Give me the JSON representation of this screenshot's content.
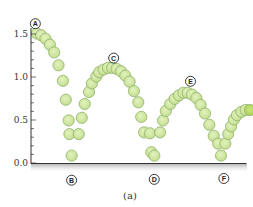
{
  "chart_data": {
    "type": "scatter",
    "title": "",
    "caption": "(a)",
    "xlabel": "",
    "ylabel": "",
    "ylim": [
      0.0,
      1.6
    ],
    "yticks": [
      0.0,
      0.5,
      1.0,
      1.5
    ],
    "ytick_labels": [
      "0.0",
      "0.5",
      "1.0",
      "1.5"
    ],
    "grid": false,
    "legend": null,
    "annotations": [
      {
        "label": "A",
        "x": 0.03,
        "y": 1.62,
        "note": "release point, top"
      },
      {
        "label": "B",
        "x": 0.28,
        "y": -0.2,
        "note": "first bounce"
      },
      {
        "label": "C",
        "x": 0.57,
        "y": 1.22,
        "note": "second peak"
      },
      {
        "label": "D",
        "x": 0.85,
        "y": -0.19,
        "note": "second bounce"
      },
      {
        "label": "E",
        "x": 1.1,
        "y": 0.95,
        "note": "third peak"
      },
      {
        "label": "F",
        "x": 1.33,
        "y": -0.18,
        "note": "third bounce"
      }
    ],
    "series": [
      {
        "name": "ball positions",
        "color": "#cfe6a0",
        "edge_color": "#8fb36a",
        "points": [
          [
            0.04,
            1.5
          ],
          [
            0.07,
            1.48
          ],
          [
            0.1,
            1.44
          ],
          [
            0.13,
            1.37
          ],
          [
            0.16,
            1.28
          ],
          [
            0.19,
            1.13
          ],
          [
            0.22,
            0.95
          ],
          [
            0.24,
            0.73
          ],
          [
            0.26,
            0.49
          ],
          [
            0.265,
            0.33
          ],
          [
            0.28,
            0.08
          ],
          [
            0.33,
            0.33
          ],
          [
            0.35,
            0.52
          ],
          [
            0.37,
            0.68
          ],
          [
            0.4,
            0.82
          ],
          [
            0.42,
            0.92
          ],
          [
            0.45,
            1.0
          ],
          [
            0.47,
            1.05
          ],
          [
            0.5,
            1.08
          ],
          [
            0.53,
            1.1
          ],
          [
            0.56,
            1.1
          ],
          [
            0.59,
            1.09
          ],
          [
            0.62,
            1.06
          ],
          [
            0.65,
            1.01
          ],
          [
            0.68,
            0.94
          ],
          [
            0.71,
            0.83
          ],
          [
            0.74,
            0.7
          ],
          [
            0.76,
            0.53
          ],
          [
            0.78,
            0.35
          ],
          [
            0.82,
            0.34
          ],
          [
            0.83,
            0.12
          ],
          [
            0.85,
            0.08
          ],
          [
            0.89,
            0.35
          ],
          [
            0.91,
            0.49
          ],
          [
            0.93,
            0.6
          ],
          [
            0.96,
            0.68
          ],
          [
            0.99,
            0.74
          ],
          [
            1.02,
            0.78
          ],
          [
            1.05,
            0.81
          ],
          [
            1.08,
            0.81
          ],
          [
            1.11,
            0.79
          ],
          [
            1.14,
            0.75
          ],
          [
            1.17,
            0.67
          ],
          [
            1.2,
            0.57
          ],
          [
            1.23,
            0.44
          ],
          [
            1.26,
            0.31
          ],
          [
            1.29,
            0.22
          ],
          [
            1.31,
            0.08
          ],
          [
            1.34,
            0.22
          ],
          [
            1.36,
            0.33
          ],
          [
            1.38,
            0.42
          ],
          [
            1.4,
            0.5
          ],
          [
            1.42,
            0.55
          ],
          [
            1.45,
            0.59
          ],
          [
            1.48,
            0.61
          ],
          [
            1.51,
            0.61
          ]
        ]
      }
    ]
  }
}
